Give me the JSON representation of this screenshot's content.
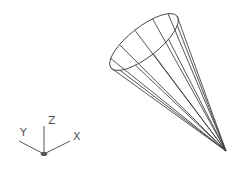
{
  "viewport": {
    "background": "#ffffff",
    "line_color": "#444444"
  },
  "model": {
    "object": "cone",
    "display": "wireframe",
    "base_ellipse": {
      "cx": 144,
      "cy": 42,
      "rx": 42,
      "ry": 15,
      "rotation": -38
    },
    "apex": {
      "x": 226,
      "y": 151
    },
    "generator_count": 12
  },
  "ucs_icon": {
    "origin": {
      "x": 44,
      "y": 154
    },
    "axes": [
      {
        "name": "X",
        "label": "X"
      },
      {
        "name": "Y",
        "label": "Y"
      },
      {
        "name": "Z",
        "label": "Z"
      }
    ]
  }
}
